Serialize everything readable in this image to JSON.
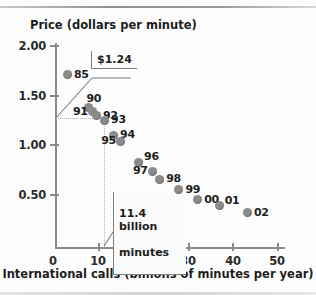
{
  "chart_data": {
    "type": "scatter",
    "title": "",
    "xlabel": "International calls (billions of minutes per year)",
    "ylabel": "Price (dollars per minute)",
    "xlim": [
      0,
      52
    ],
    "ylim": [
      0,
      2.1
    ],
    "xticks": [
      "0",
      "10",
      "20",
      "30",
      "40",
      "50"
    ],
    "xtick_values": [
      0,
      10,
      20,
      30,
      40,
      50
    ],
    "yticks": [
      "0.50",
      "1.00",
      "1.50",
      "2.00"
    ],
    "ytick_values": [
      0.5,
      1.0,
      1.5,
      2.0
    ],
    "grid": false,
    "legend": "none",
    "point_color": "#8b8b8b",
    "axis_color": "#8a8a8a",
    "points": [
      {
        "label": "85",
        "x": 3.1,
        "y": 1.7,
        "label_pos": "right"
      },
      {
        "label": "90",
        "x": 7.8,
        "y": 1.37,
        "label_pos": "above"
      },
      {
        "label": "91",
        "x": 8.7,
        "y": 1.33,
        "label_pos": "left"
      },
      {
        "label": "92",
        "x": 9.6,
        "y": 1.29,
        "label_pos": "right"
      },
      {
        "label": "93",
        "x": 11.4,
        "y": 1.24,
        "label_pos": "right"
      },
      {
        "label": "94",
        "x": 13.4,
        "y": 1.09,
        "label_pos": "right"
      },
      {
        "label": "95",
        "x": 15.0,
        "y": 1.03,
        "label_pos": "left"
      },
      {
        "label": "96",
        "x": 19.0,
        "y": 0.82,
        "label_pos": "above-right"
      },
      {
        "label": "97",
        "x": 22.1,
        "y": 0.73,
        "label_pos": "left"
      },
      {
        "label": "98",
        "x": 23.7,
        "y": 0.65,
        "label_pos": "right"
      },
      {
        "label": "99",
        "x": 28.0,
        "y": 0.54,
        "label_pos": "right"
      },
      {
        "label": "00",
        "x": 32.2,
        "y": 0.44,
        "label_pos": "right"
      },
      {
        "label": "01",
        "x": 37.0,
        "y": 0.38,
        "label_pos": "above-right"
      },
      {
        "label": "02",
        "x": 43.3,
        "y": 0.31,
        "label_pos": "right"
      }
    ],
    "annotations": [
      {
        "name": "price-callout",
        "text": "$1.24",
        "points_to_y": 1.24
      },
      {
        "name": "minutes-callout",
        "text": "11.4 billion\nminutes",
        "points_to_x": 11.4
      }
    ],
    "guides": [
      {
        "type": "vertical",
        "value": 11.4,
        "style": "dotted"
      },
      {
        "type": "horizontal",
        "value": 1.24,
        "style": "dotted"
      }
    ]
  },
  "axes": {
    "y_title": "Price (dollars per minute)",
    "x_title": "International calls (billions of minutes per year)",
    "y_ticks": [
      {
        "label": "2.00",
        "top": 39
      },
      {
        "label": "1.50",
        "top": 89
      },
      {
        "label": "1.00",
        "top": 138
      },
      {
        "label": "0.50",
        "top": 188
      }
    ],
    "x_ticks": [
      {
        "label": "0",
        "left": 38
      },
      {
        "label": "10",
        "left": 83
      },
      {
        "label": "20",
        "left": 128
      },
      {
        "label": "30",
        "left": 173
      },
      {
        "label": "40",
        "left": 218
      },
      {
        "label": "50",
        "left": 262
      }
    ]
  },
  "callouts": {
    "price": "$1.24",
    "minutes_line1": "11.4 billion",
    "minutes_line2": "minutes"
  }
}
